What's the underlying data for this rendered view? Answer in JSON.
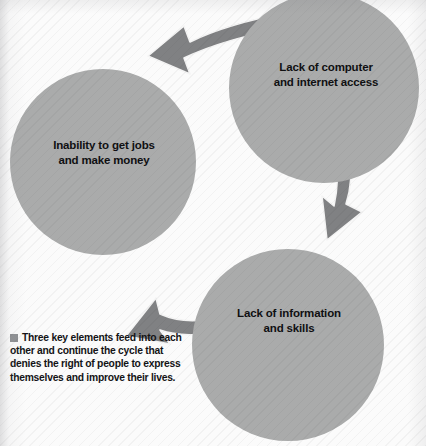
{
  "page": {
    "cropped_header_fragment": "",
    "background_color": "#fbfbfb"
  },
  "colors": {
    "node_fill": "#aaabab",
    "arrow_fill": "#808183",
    "arrow_outline": "#f2f2f2",
    "label_text": "#101012",
    "caption_bullet": "#8e9093"
  },
  "diagram": {
    "type": "cycle",
    "direction": "counterclockwise",
    "nodes": [
      {
        "id": "computer",
        "label": "Lack of computer\nand internet access",
        "position": "top-right",
        "cx": 324,
        "cy": 88,
        "r": 95
      },
      {
        "id": "jobs",
        "label": "Inability to get jobs\nand make money",
        "position": "left",
        "cx": 103,
        "cy": 162,
        "r": 93
      },
      {
        "id": "info",
        "label": "Lack of information\nand skills",
        "position": "bottom-right",
        "cx": 288,
        "cy": 345,
        "r": 96
      }
    ],
    "arrows": [
      {
        "id": "computer-to-jobs",
        "from": "computer",
        "to": "jobs",
        "position": "top",
        "points": "up-left"
      },
      {
        "id": "computer-to-info",
        "from": "computer",
        "to": "info",
        "position": "right",
        "points": "down-left"
      },
      {
        "id": "info-to-jobs",
        "from": "info",
        "to": "jobs",
        "position": "bottom",
        "points": "up-left"
      }
    ]
  },
  "caption": {
    "bullet": "square-bullet",
    "text": "Three key elements feed into each other and continue the cycle that denies the right of people to express themselves and improve their lives."
  }
}
